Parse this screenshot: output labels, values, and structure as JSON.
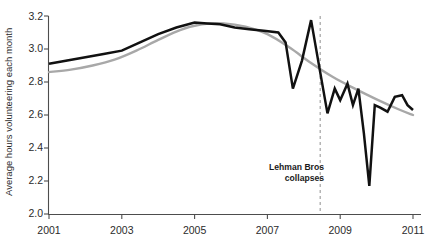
{
  "chart_data": {
    "type": "line",
    "title": "",
    "subtitle": "",
    "xlabel": "",
    "ylabel": "Average hours volunteering each month",
    "xlim": [
      2001.0,
      2011.0
    ],
    "ylim": [
      2.0,
      3.2
    ],
    "grid": false,
    "legend": "none",
    "x_ticks": [
      "2001",
      "2003",
      "2005",
      "2007",
      "2009",
      "2011"
    ],
    "x_tick_values": [
      2001,
      2003,
      2005,
      2007,
      2009,
      2011
    ],
    "y_ticks": [
      "2.0",
      "2.2",
      "2.4",
      "2.6",
      "2.8",
      "3.0",
      "3.2"
    ],
    "y_tick_values": [
      2.0,
      2.2,
      2.4,
      2.6,
      2.8,
      3.0,
      3.2
    ],
    "series": [
      {
        "name": "Average hours volunteering each month",
        "color": "#111111",
        "style": "solid",
        "x": [
          2001.0,
          2001.5,
          2002.0,
          2002.5,
          2003.0,
          2003.5,
          2004.0,
          2004.5,
          2005.0,
          2005.35,
          2005.7,
          2006.1,
          2006.5,
          2006.9,
          2007.3,
          2007.5,
          2007.7,
          2007.95,
          2008.2,
          2008.45,
          2008.65,
          2008.85,
          2009.0,
          2009.2,
          2009.35,
          2009.5,
          2009.65,
          2009.8,
          2009.95,
          2010.1,
          2010.3,
          2010.5,
          2010.7,
          2010.85,
          2011.0
        ],
        "y": [
          2.91,
          2.93,
          2.95,
          2.97,
          2.99,
          3.04,
          3.09,
          3.13,
          3.16,
          3.155,
          3.15,
          3.13,
          3.12,
          3.11,
          3.1,
          3.04,
          2.76,
          2.93,
          3.175,
          2.86,
          2.61,
          2.76,
          2.69,
          2.79,
          2.66,
          2.76,
          2.49,
          2.17,
          2.66,
          2.645,
          2.62,
          2.71,
          2.72,
          2.66,
          2.63
        ]
      },
      {
        "name": "Smoothed trend",
        "color": "#a8a8a8",
        "style": "solid",
        "x": [
          2001.0,
          2001.6,
          2002.2,
          2002.8,
          2003.4,
          2004.0,
          2004.6,
          2005.2,
          2005.8,
          2006.4,
          2007.0,
          2007.6,
          2008.2,
          2008.8,
          2009.4,
          2010.0,
          2010.6,
          2011.0
        ],
        "y": [
          2.86,
          2.875,
          2.9,
          2.935,
          2.99,
          3.055,
          3.115,
          3.15,
          3.155,
          3.135,
          3.09,
          3.01,
          2.915,
          2.83,
          2.76,
          2.695,
          2.635,
          2.6
        ]
      }
    ],
    "annotations": [
      {
        "name": "lehman-event",
        "line1": "Lehman Bros",
        "line2": "collapses",
        "x_value": 2008.45,
        "marker": "vertical-dashed-line",
        "marker_color": "#9a9a9a"
      }
    ]
  }
}
